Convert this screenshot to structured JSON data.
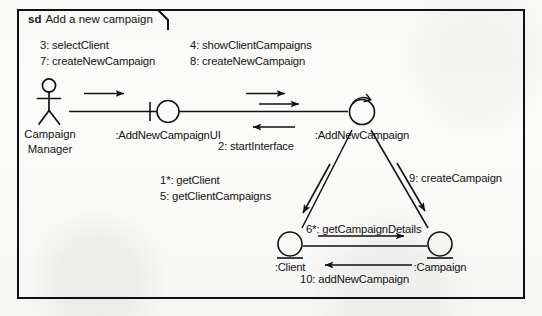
{
  "diagram": {
    "frame": {
      "kind": "sd",
      "title": "Add a new campaign"
    },
    "participants": [
      {
        "id": "campaign-manager",
        "name_line1": "Campaign",
        "name_line2": "Manager",
        "stereotype": "actor"
      },
      {
        "id": "add-new-campaign-ui",
        "name": ":AddNewCampaignUI",
        "stereotype": "boundary"
      },
      {
        "id": "add-new-campaign",
        "name": ":AddNewCampaign",
        "stereotype": "control"
      },
      {
        "id": "client",
        "name": ":Client",
        "stereotype": "entity"
      },
      {
        "id": "campaign",
        "name": ":Campaign",
        "stereotype": "entity"
      }
    ],
    "messages": [
      {
        "id": "msg-3",
        "label": "3: selectClient",
        "from": "campaign-manager",
        "to": "add-new-campaign-ui"
      },
      {
        "id": "msg-7",
        "label": "7: createNewCampaign",
        "from": "campaign-manager",
        "to": "add-new-campaign-ui"
      },
      {
        "id": "msg-4",
        "label": "4: showClientCampaigns",
        "from": "add-new-campaign-ui",
        "to": "add-new-campaign"
      },
      {
        "id": "msg-8",
        "label": "8: createNewCampaign",
        "from": "add-new-campaign-ui",
        "to": "add-new-campaign"
      },
      {
        "id": "msg-2",
        "label": "2: startInterface",
        "from": "add-new-campaign",
        "to": "add-new-campaign-ui"
      },
      {
        "id": "msg-1",
        "label": "1*: getClient",
        "from": "add-new-campaign",
        "to": "client"
      },
      {
        "id": "msg-5",
        "label": "5: getClientCampaigns",
        "from": "add-new-campaign",
        "to": "client"
      },
      {
        "id": "msg-9",
        "label": "9: createCampaign",
        "from": "add-new-campaign",
        "to": "campaign"
      },
      {
        "id": "msg-6",
        "label": "6*: getCampaignDetails",
        "from": "client",
        "to": "campaign"
      },
      {
        "id": "msg-10",
        "label": "10: addNewCampaign",
        "from": "campaign",
        "to": "client"
      }
    ],
    "colors": {
      "stroke": "#111111",
      "background": "#fbfbf9",
      "text": "#141414"
    }
  }
}
